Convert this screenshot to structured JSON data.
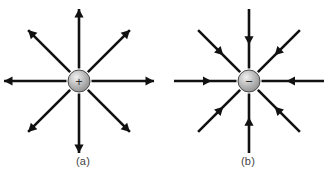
{
  "figure": {
    "background_color": "#ffffff",
    "width": 331,
    "height": 179
  },
  "panels": [
    {
      "id": "a",
      "caption": "(a)",
      "charge_sign": "+",
      "charge_label": "+",
      "charge_type": "positive",
      "field_direction": "outward",
      "center": {
        "x": 79,
        "y": 81
      },
      "charge_radius": 11,
      "charge_fill_light": "#f0f0f0",
      "charge_fill_mid": "#b9b9b9",
      "charge_fill_dark": "#8f8f8f",
      "charge_stroke": "#4a4a4a",
      "line_color": "#111111",
      "line_width": 2.6,
      "num_field_lines": 8,
      "arrowhead_position": "tip",
      "field_lines": [
        {
          "name": "north",
          "angle_deg": 90,
          "length": 72,
          "arrow": "outward"
        },
        {
          "name": "north-east",
          "angle_deg": 45,
          "length": 72,
          "arrow": "outward"
        },
        {
          "name": "east",
          "angle_deg": 0,
          "length": 75,
          "arrow": "outward"
        },
        {
          "name": "south-east",
          "angle_deg": -45,
          "length": 72,
          "arrow": "outward"
        },
        {
          "name": "south",
          "angle_deg": -90,
          "length": 72,
          "arrow": "outward"
        },
        {
          "name": "south-west",
          "angle_deg": -135,
          "length": 72,
          "arrow": "outward"
        },
        {
          "name": "west",
          "angle_deg": 180,
          "length": 75,
          "arrow": "outward"
        },
        {
          "name": "north-west",
          "angle_deg": 135,
          "length": 72,
          "arrow": "outward"
        }
      ]
    },
    {
      "id": "b",
      "caption": "(b)",
      "charge_sign": "−",
      "charge_label": "−",
      "charge_type": "negative",
      "field_direction": "inward",
      "center": {
        "x": 84,
        "y": 81
      },
      "charge_radius": 11,
      "charge_fill_light": "#f0f0f0",
      "charge_fill_mid": "#b9b9b9",
      "charge_fill_dark": "#8f8f8f",
      "charge_stroke": "#4a4a4a",
      "line_color": "#111111",
      "line_width": 2.6,
      "num_field_lines": 8,
      "arrowhead_position": "midline",
      "field_lines": [
        {
          "name": "north",
          "angle_deg": 90,
          "length": 72,
          "arrow": "inward"
        },
        {
          "name": "north-east",
          "angle_deg": 45,
          "length": 72,
          "arrow": "inward"
        },
        {
          "name": "east",
          "angle_deg": 0,
          "length": 75,
          "arrow": "inward"
        },
        {
          "name": "south-east",
          "angle_deg": -45,
          "length": 72,
          "arrow": "inward"
        },
        {
          "name": "south",
          "angle_deg": -90,
          "length": 72,
          "arrow": "inward"
        },
        {
          "name": "south-west",
          "angle_deg": -135,
          "length": 72,
          "arrow": "inward"
        },
        {
          "name": "west",
          "angle_deg": 180,
          "length": 75,
          "arrow": "inward"
        },
        {
          "name": "north-west",
          "angle_deg": 135,
          "length": 72,
          "arrow": "inward"
        }
      ]
    }
  ]
}
